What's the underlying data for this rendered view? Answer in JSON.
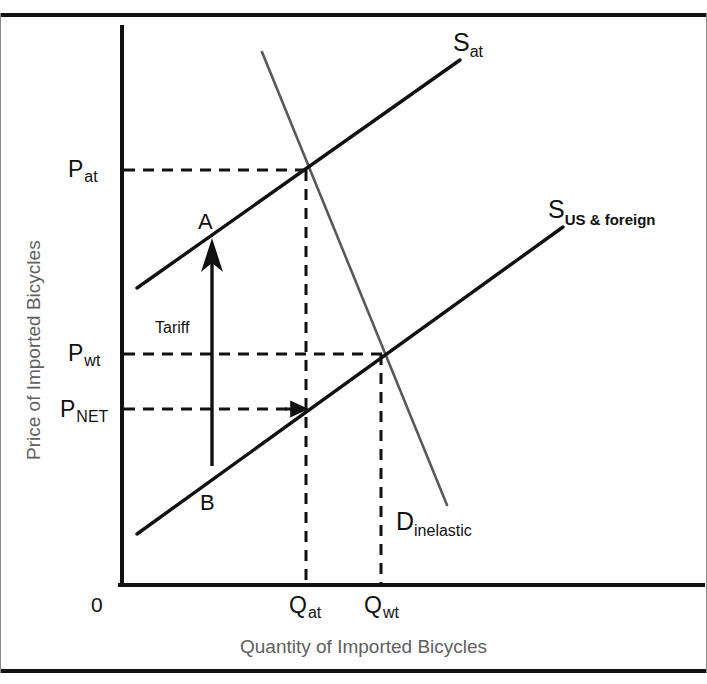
{
  "chart_data": {
    "type": "line",
    "title": "",
    "xlabel": "Quantity of Imported Bicycles",
    "ylabel": "Price of Imported Bicycles",
    "origin_label": "0",
    "grid": false,
    "legend": "none",
    "axis_note": "Unlabeled qualitative axes; values are schematic positions",
    "series": [
      {
        "name": "S_at",
        "label": "S",
        "sublabel": "at",
        "description": "Supply curve of imports after tariff (shifted up)",
        "color": "#111111",
        "points": [
          [
            137,
            288
          ],
          [
            460,
            60
          ]
        ]
      },
      {
        "name": "S_US_and_foreign",
        "label": "S",
        "sublabel": "US & foreign",
        "description": "Combined US and foreign supply curve before tariff",
        "color": "#111111",
        "points": [
          [
            137,
            534
          ],
          [
            563,
            227
          ]
        ]
      },
      {
        "name": "D_inelastic",
        "label": "D",
        "sublabel": "inelastic",
        "description": "Inelastic demand curve, steeply downward sloping",
        "color": "#595959",
        "points": [
          [
            262,
            52
          ],
          [
            447,
            505
          ]
        ]
      }
    ],
    "price_markers": [
      {
        "id": "p_at",
        "label": "P",
        "sublabel": "at",
        "y": 170,
        "description": "Price after tariff"
      },
      {
        "id": "p_wt",
        "label": "P",
        "sublabel": "wt",
        "y": 354,
        "description": "World price / price without tariff"
      },
      {
        "id": "p_net",
        "label": "P",
        "sublabel": "NET",
        "y": 409,
        "description": "Net price received by foreign supplier"
      }
    ],
    "quantity_markers": [
      {
        "id": "q_at",
        "label": "Q",
        "sublabel": "at",
        "x": 306,
        "description": "Quantity imported after tariff"
      },
      {
        "id": "q_wt",
        "label": "Q",
        "sublabel": "wt",
        "x": 381,
        "description": "Quantity imported without tariff"
      }
    ],
    "annotations": [
      {
        "id": "point-a",
        "text": "A",
        "description": "Equilibrium on post-tariff supply curve at Q_at, P_at"
      },
      {
        "id": "point-b",
        "text": "B",
        "description": "Point on pre-tariff supply curve at Q_at, P_NET"
      },
      {
        "id": "tariff-arrow",
        "text": "Tariff",
        "description": "Vertical arrow from B up to A measuring the tariff, the gap between P_at and P_NET"
      }
    ]
  },
  "labels": {
    "y_axis_title": "Price of Imported Bicycles",
    "x_axis_title": "Quantity of Imported Bicycles",
    "origin": "0",
    "p_at": "P",
    "p_at_sub": "at",
    "p_wt": "P",
    "p_wt_sub": "wt",
    "p_net": "P",
    "p_net_sub": "NET",
    "q_at": "Q",
    "q_at_sub": "at",
    "q_wt": "Q",
    "q_wt_sub": "wt",
    "s_at": "S",
    "s_at_sub": "at",
    "s_us": "S",
    "s_us_sub": "US & foreign",
    "d_label": "D",
    "d_sub": "inelastic",
    "point_a": "A",
    "point_b": "B",
    "tariff": "Tariff"
  },
  "colors": {
    "ink": "#111111",
    "demand_line": "#595959",
    "axis_title": "#606060",
    "frame": "#111111",
    "frame_side": "#8a8a8a"
  }
}
